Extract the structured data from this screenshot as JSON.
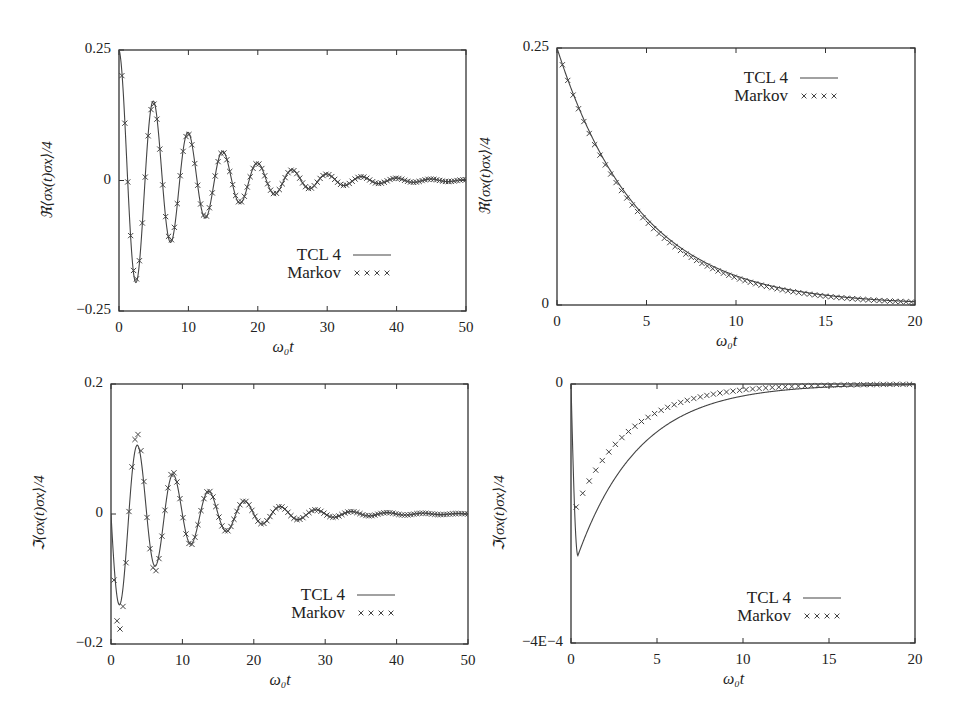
{
  "chart_data": [
    {
      "id": "tl",
      "type": "line",
      "title": "",
      "xlabel": "ω₀t",
      "ylabel": "ℜ⟨σx(t)σx⟩/4",
      "xlim": [
        0,
        50
      ],
      "ylim": [
        -0.25,
        0.25
      ],
      "xticks": [
        0,
        10,
        20,
        30,
        40,
        50
      ],
      "xtick_labels": [
        "0",
        "10",
        "20",
        "30",
        "40",
        "50"
      ],
      "yticks": [
        -0.25,
        0,
        0.25
      ],
      "ytick_labels": [
        "−0.25",
        "0",
        "0.25"
      ],
      "grid": false,
      "legend_position": "lower right",
      "frame": {
        "left": 119,
        "top": 50,
        "right": 466,
        "bottom": 311
      },
      "legend": {
        "x": 323,
        "y": 245
      },
      "model": {
        "kind": "damped_cos",
        "A": 0.25,
        "tau": 10,
        "omega": 1.257
      },
      "series": [
        {
          "name": "TCL 4",
          "style": "line"
        },
        {
          "name": "Markov",
          "style": "x",
          "step": 0.42
        }
      ]
    },
    {
      "id": "tr",
      "type": "line",
      "title": "",
      "xlabel": "ω₀t",
      "ylabel": "ℜ⟨σx(t)σx⟩/4",
      "xlim": [
        0,
        20
      ],
      "ylim": [
        0,
        0.25
      ],
      "xticks": [
        0,
        5,
        10,
        15,
        20
      ],
      "xtick_labels": [
        "0",
        "5",
        "10",
        "15",
        "20"
      ],
      "yticks": [
        0,
        0.25
      ],
      "ytick_labels": [
        "0",
        "0.25"
      ],
      "grid": false,
      "legend_position": "upper right",
      "frame": {
        "left": 557,
        "top": 48,
        "right": 915,
        "bottom": 305
      },
      "legend": {
        "x": 770,
        "y": 68
      },
      "model": {
        "kind": "exp",
        "A": 0.25,
        "tau": 4.6,
        "markov_tau": 4.45
      },
      "series": [
        {
          "name": "TCL 4",
          "style": "line"
        },
        {
          "name": "Markov",
          "style": "x",
          "step": 0.3
        }
      ]
    },
    {
      "id": "bl",
      "type": "line",
      "title": "",
      "xlabel": "ω₀t",
      "ylabel": "ℑ⟨σx(t)σx⟩/4",
      "xlim": [
        0,
        50
      ],
      "ylim": [
        -0.2,
        0.2
      ],
      "xticks": [
        0,
        10,
        20,
        30,
        40,
        50
      ],
      "xtick_labels": [
        "0",
        "10",
        "20",
        "30",
        "40",
        "50"
      ],
      "yticks": [
        -0.2,
        0,
        0.2
      ],
      "ytick_labels": [
        "−0.2",
        "0",
        "0.2"
      ],
      "grid": false,
      "legend_position": "lower right",
      "frame": {
        "left": 111,
        "top": 384,
        "right": 468,
        "bottom": 644
      },
      "legend": {
        "x": 327,
        "y": 585
      },
      "model": {
        "kind": "damped_sin",
        "A": -0.16,
        "tau": 9,
        "omega": 1.257
      },
      "series": [
        {
          "name": "TCL 4",
          "style": "line"
        },
        {
          "name": "Markov",
          "style": "x",
          "step": 0.42
        }
      ]
    },
    {
      "id": "br",
      "type": "line",
      "title": "",
      "xlabel": "ω₀t",
      "ylabel": "ℑ⟨σx(t)σx⟩/4",
      "xlim": [
        0,
        20
      ],
      "ylim": [
        -0.0004,
        0
      ],
      "xticks": [
        0,
        5,
        10,
        15,
        20
      ],
      "xtick_labels": [
        "0",
        "5",
        "10",
        "15",
        "20"
      ],
      "yticks": [
        -0.0004,
        0
      ],
      "ytick_labels": [
        "−4E−4",
        "0",
        ""
      ],
      "grid": false,
      "legend_position": "lower right",
      "frame": {
        "left": 571,
        "top": 384,
        "right": 915,
        "bottom": 643
      },
      "legend": {
        "x": 773,
        "y": 588
      },
      "model": {
        "kind": "dip_exp",
        "A": -0.000265,
        "tmin": 0.4,
        "tau": 3.6,
        "markov_A": -0.00019,
        "markov_tau": 3.2
      },
      "series": [
        {
          "name": "TCL 4",
          "style": "line"
        },
        {
          "name": "Markov",
          "style": "x",
          "step": 0.38
        }
      ]
    }
  ]
}
